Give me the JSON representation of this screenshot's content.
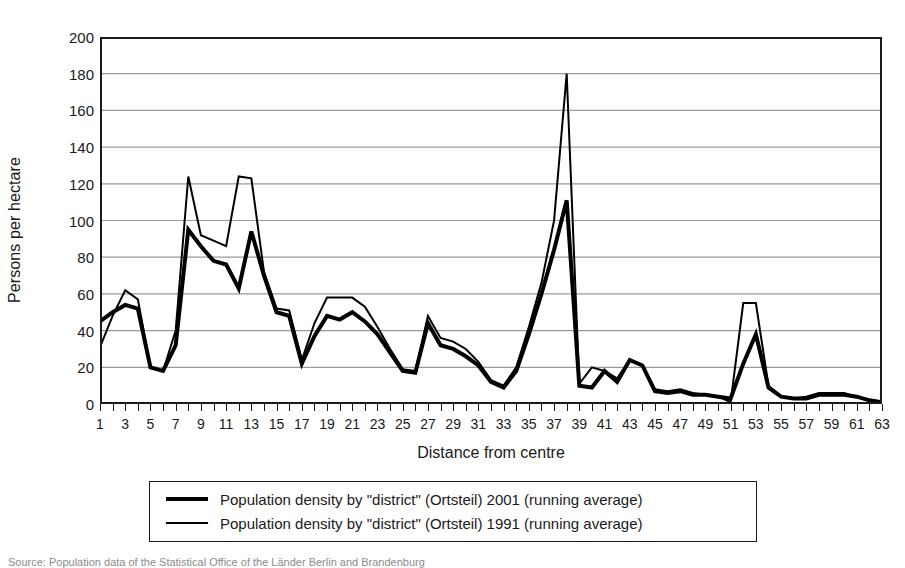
{
  "chart_data": {
    "type": "line",
    "title": "",
    "xlabel": "Distance from centre",
    "ylabel": "Persons per hectare",
    "xlim": [
      1,
      63
    ],
    "ylim": [
      0,
      200
    ],
    "ytick_step": 20,
    "yticks": [
      0,
      20,
      40,
      60,
      80,
      100,
      120,
      140,
      160,
      180,
      200
    ],
    "xticks": [
      1,
      3,
      5,
      7,
      9,
      11,
      13,
      15,
      17,
      19,
      21,
      23,
      25,
      27,
      29,
      31,
      33,
      35,
      37,
      39,
      41,
      43,
      45,
      47,
      49,
      51,
      53,
      55,
      57,
      59,
      61,
      63
    ],
    "x": [
      1,
      2,
      3,
      4,
      5,
      6,
      7,
      8,
      9,
      10,
      11,
      12,
      13,
      14,
      15,
      16,
      17,
      18,
      19,
      20,
      21,
      22,
      23,
      24,
      25,
      26,
      27,
      28,
      29,
      30,
      31,
      32,
      33,
      34,
      35,
      36,
      37,
      38,
      39,
      40,
      41,
      42,
      43,
      44,
      45,
      46,
      47,
      48,
      49,
      50,
      51,
      52,
      53,
      54,
      55,
      56,
      57,
      58,
      59,
      60,
      61,
      62,
      63
    ],
    "grid": "horizontal",
    "legend_position": "below-plot",
    "series": [
      {
        "name": "Population density by \"district\" (Ortsteil) 2001 (running average)",
        "style": "thick",
        "color": "#000000",
        "linewidth": 4,
        "values": [
          45,
          50,
          54,
          52,
          20,
          18,
          32,
          95,
          86,
          78,
          76,
          63,
          94,
          70,
          50,
          48,
          22,
          37,
          48,
          46,
          50,
          45,
          38,
          28,
          18,
          17,
          44,
          32,
          30,
          26,
          21,
          12,
          9,
          18,
          38,
          60,
          84,
          111,
          10,
          9,
          18,
          12,
          24,
          21,
          7,
          6,
          7,
          5,
          5,
          4,
          3,
          22,
          38,
          9,
          4,
          3,
          3,
          5,
          5,
          5,
          4,
          2,
          1
        ]
      },
      {
        "name": "Population density by \"district\" (Ortsteil) 1991 (running average)",
        "style": "thin",
        "color": "#000000",
        "linewidth": 2,
        "values": [
          31,
          48,
          62,
          57,
          20,
          18,
          40,
          124,
          92,
          89,
          86,
          124,
          123,
          72,
          52,
          51,
          24,
          44,
          58,
          58,
          58,
          53,
          42,
          30,
          19,
          18,
          48,
          36,
          34,
          30,
          23,
          13,
          10,
          20,
          42,
          66,
          100,
          180,
          11,
          20,
          18,
          14,
          24,
          21,
          8,
          7,
          8,
          6,
          5,
          4,
          1,
          55,
          55,
          10,
          4,
          3,
          4,
          6,
          6,
          6,
          4,
          2,
          1
        ]
      }
    ]
  },
  "axis": {
    "y_title": "Persons per hectare",
    "x_title": "Distance from centre"
  },
  "legend": {
    "items": [
      {
        "label": "Population density by \"district\" (Ortsteil) 2001 (running average)",
        "style": "thick"
      },
      {
        "label": "Population density by \"district\" (Ortsteil) 1991 (running average)",
        "style": "thin"
      }
    ]
  },
  "source": {
    "caption": "Source: Population data of the Statistical Office of the Länder Berlin and Brandenburg"
  }
}
